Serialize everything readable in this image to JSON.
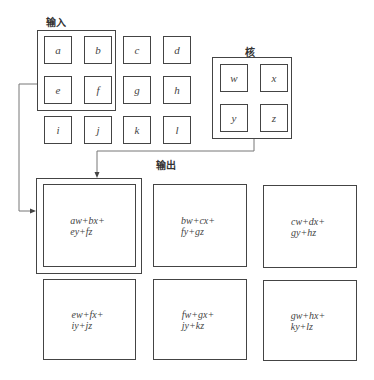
{
  "labels": {
    "input": "输入",
    "kernel": "核",
    "output": "输出"
  },
  "input_grid": [
    [
      "a",
      "b",
      "c",
      "d"
    ],
    [
      "e",
      "f",
      "g",
      "h"
    ],
    [
      "i",
      "j",
      "k",
      "l"
    ]
  ],
  "kernel_grid": [
    [
      "w",
      "x"
    ],
    [
      "y",
      "z"
    ]
  ],
  "outputs": [
    {
      "line1": "aw+bx+",
      "line2": "ey+fz"
    },
    {
      "line1": "bw+cx+",
      "line2": "fy+gz"
    },
    {
      "line1": "cw+dx+",
      "line2": "gy+hz"
    },
    {
      "line1": "ew+fx+",
      "line2": "iy+jz"
    },
    {
      "line1": "fw+gx+",
      "line2": "jy+kz"
    },
    {
      "line1": "gw+hx+",
      "line2": "ky+lz"
    }
  ]
}
